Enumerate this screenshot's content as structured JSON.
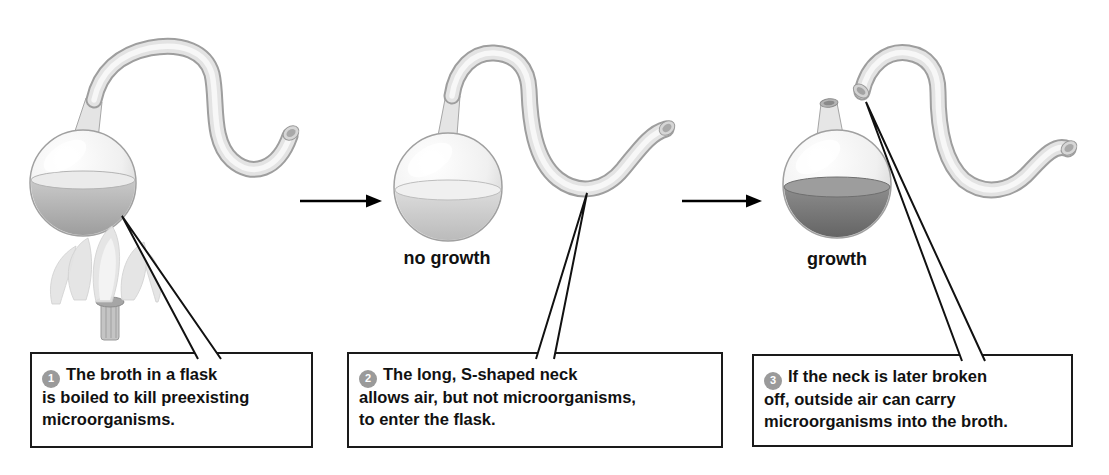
{
  "figure": {
    "colors": {
      "badge_fill": "#9a9a9a",
      "badge_text": "#ffffff",
      "broth_boiled": "#aaaaaa",
      "broth_no_growth": "#c9c9c9",
      "broth_growth": "#6e6e6e",
      "box_border": "#1a1a1a",
      "arrow": "#000000"
    },
    "stages": [
      {
        "badge": "1",
        "caption": "The broth in a flask\nis boiled to kill preexisting\nmicroorganisms."
      },
      {
        "badge": "2",
        "label": "no growth",
        "caption": "The long, S-shaped neck\nallows air, but not microorganisms,\nto enter the flask."
      },
      {
        "badge": "3",
        "label": "growth",
        "caption": "If the neck is later broken\noff, outside air can carry\nmicroorganisms into the broth."
      }
    ]
  }
}
